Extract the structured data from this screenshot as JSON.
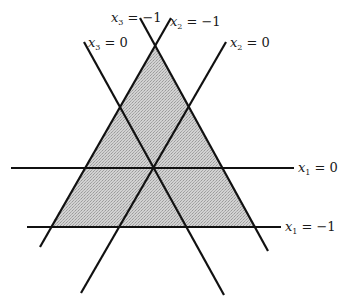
{
  "figure": {
    "width": 345,
    "height": 307,
    "colors": {
      "line": "#111111",
      "shade": "#c9c9c9",
      "text": "#1a1a1a",
      "background": "#ffffff"
    },
    "shaded_region": {
      "name": "feasible-triangle",
      "points": [
        [
          155,
          47
        ],
        [
          50,
          227
        ],
        [
          256,
          227
        ]
      ]
    },
    "lines": [
      {
        "id": "x1-eq-0",
        "var": "x",
        "sub": "1",
        "rhs": "= 0",
        "x1": 11,
        "y1": 168,
        "x2": 294,
        "y2": 168,
        "label_x": 298,
        "label_y": 172
      },
      {
        "id": "x1-eq-minus1",
        "var": "x",
        "sub": "1",
        "rhs": "= −1",
        "x1": 27,
        "y1": 227,
        "x2": 281,
        "y2": 227,
        "label_x": 285,
        "label_y": 231
      },
      {
        "id": "x2-eq-0",
        "var": "x",
        "sub": "2",
        "rhs": "= 0",
        "x1": 226,
        "y1": 42,
        "x2": 81,
        "y2": 293,
        "label_x": 230,
        "label_y": 47
      },
      {
        "id": "x3-eq-0",
        "var": "x",
        "sub": "3",
        "rhs": "= 0",
        "x1": 84,
        "y1": 42,
        "x2": 224,
        "y2": 295,
        "label_x": 88,
        "label_y": 47
      },
      {
        "id": "x3-eq-minus1",
        "var": "x",
        "sub": "3",
        "rhs": "= −1",
        "x1": 140,
        "y1": 18,
        "x2": 268,
        "y2": 251,
        "label_x": 112,
        "label_y": 22
      },
      {
        "id": "x2-eq-minus1",
        "var": "x",
        "sub": "2",
        "rhs": "= −1",
        "x1": 171,
        "y1": 18,
        "x2": 40,
        "y2": 247,
        "label_x": 170,
        "label_y": 25
      }
    ],
    "labels": {
      "x1_eq_0": {
        "var": "x",
        "sub": "1",
        "rhs": "= 0"
      },
      "x1_eq_minus1": {
        "var": "x",
        "sub": "1",
        "rhs": "= −1"
      },
      "x2_eq_0": {
        "var": "x",
        "sub": "2",
        "rhs": "= 0"
      },
      "x3_eq_0": {
        "var": "x",
        "sub": "3",
        "rhs": "= 0"
      },
      "x3_eq_minus1": {
        "var": "x",
        "sub": "3",
        "rhs": "= −1"
      },
      "x2_eq_minus1": {
        "var": "x",
        "sub": "2",
        "rhs": "= −1"
      }
    }
  }
}
